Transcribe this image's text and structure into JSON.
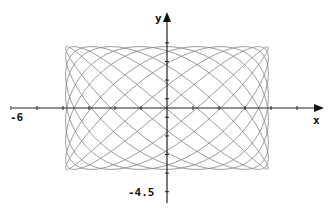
{
  "chart_data": {
    "type": "line",
    "title": "",
    "xlabel": "x",
    "ylabel": "y",
    "x_tick_label": "-6",
    "y_tick_label": "-4.5",
    "xlim": [
      -6,
      6
    ],
    "ylim": [
      -4.5,
      4.5
    ],
    "grid": false,
    "legend": null,
    "series": [
      {
        "name": "lissajous",
        "description": "parametric Lissajous curve x = A sin(8t), y = B cos(11t)",
        "x_amplitude": 3.9,
        "y_amplitude": 3.3,
        "x_frequency": 8,
        "y_frequency": 11,
        "color": "#888888"
      }
    ]
  },
  "layout": {
    "origin_px": [
      167,
      108
    ],
    "x_unit_px": 26,
    "y_unit_px": 18.6,
    "axis_color": "#222222",
    "curve_color": "#8a8a8a"
  }
}
